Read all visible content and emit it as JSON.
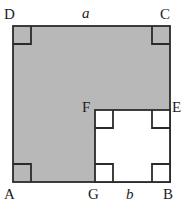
{
  "figure": {
    "kind": "geometry-diagram",
    "colors": {
      "shaded_fill": "#b8b8b8",
      "unshaded_fill": "#ffffff",
      "stroke": "#2b2b2b",
      "background": "#ffffff",
      "label_color": "#1d1d1d"
    },
    "geometry": {
      "outer_square": {
        "left": 13,
        "top": 26,
        "right": 170,
        "bottom": 182
      },
      "inner_square": {
        "left": 95,
        "top": 110,
        "right": 170,
        "bottom": 182
      },
      "right_angle_marker_size": 18,
      "stroke_width": 1.8
    },
    "labels": {
      "D": "D",
      "a": "a",
      "C": "C",
      "F": "F",
      "E": "E",
      "A": "A",
      "G": "G",
      "b": "b",
      "B": "B"
    },
    "right_angle_markers": [
      {
        "name": "angle-marker-D",
        "corner": "D",
        "x": 13,
        "y": 26,
        "dx": 1,
        "dy": 1
      },
      {
        "name": "angle-marker-C",
        "corner": "C",
        "x": 170,
        "y": 26,
        "dx": -1,
        "dy": 1
      },
      {
        "name": "angle-marker-A",
        "corner": "A",
        "x": 13,
        "y": 182,
        "dx": 1,
        "dy": -1
      },
      {
        "name": "angle-marker-F",
        "corner": "F",
        "x": 95,
        "y": 110,
        "dx": 1,
        "dy": 1
      },
      {
        "name": "angle-marker-E",
        "corner": "E",
        "x": 170,
        "y": 110,
        "dx": -1,
        "dy": 1
      },
      {
        "name": "angle-marker-G",
        "corner": "G",
        "x": 95,
        "y": 182,
        "dx": 1,
        "dy": -1
      },
      {
        "name": "angle-marker-B",
        "corner": "B",
        "x": 170,
        "y": 182,
        "dx": -1,
        "dy": -1
      }
    ]
  }
}
